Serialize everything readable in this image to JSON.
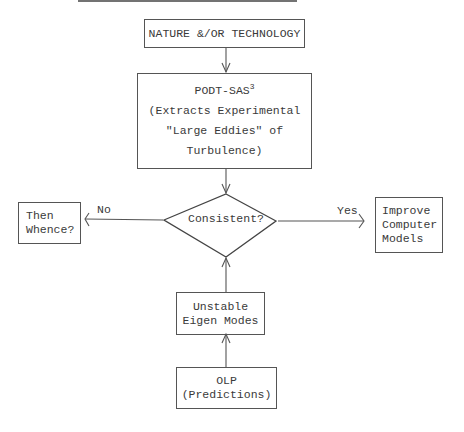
{
  "nodes": {
    "source": {
      "text": "NATURE &/OR TECHNOLOGY"
    },
    "podt": {
      "title": "PODT-SAS",
      "superscript": "3",
      "lines": [
        "(Extracts Experimental",
        "\"Large Eddies\" of",
        "Turbulence)"
      ]
    },
    "decision": {
      "text": "Consistent?"
    },
    "no_target": {
      "lines": [
        "Then",
        "Whence?"
      ]
    },
    "yes_target": {
      "lines": [
        "Improve",
        "Computer",
        "Models"
      ]
    },
    "eigen": {
      "lines": [
        "Unstable",
        "Eigen Modes"
      ]
    },
    "olp": {
      "lines": [
        "OLP",
        "(Predictions)"
      ]
    }
  },
  "edges": {
    "no_label": "No",
    "yes_label": "Yes"
  }
}
